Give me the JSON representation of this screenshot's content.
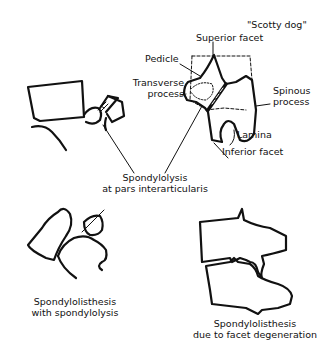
{
  "figure": {
    "title_annotation": "\"Scotty dog\"",
    "labels": {
      "superior_facet": "Superior facet",
      "pedicle": "Pedicle",
      "transverse_process_line1": "Transverse",
      "transverse_process_line2": "process",
      "spinous_process_line1": "Spinous",
      "spinous_process_line2": "process",
      "lamina": "Lamina",
      "inferior_facet": "Inferior facet",
      "spondylolysis_line1": "Spondylolysis",
      "spondylolysis_line2": "at pars interarticularis"
    },
    "captions": {
      "left_line1": "Spondylolisthesis",
      "left_line2": "with spondylolysis",
      "right_line1": "Spondylolisthesis",
      "right_line2": "due to facet degeneration"
    },
    "colors": {
      "ink": "#111111",
      "background": "#ffffff"
    }
  }
}
